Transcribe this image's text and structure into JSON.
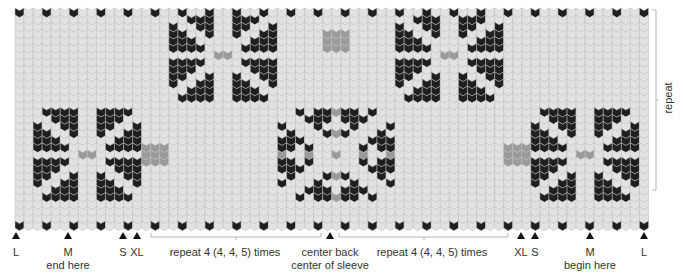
{
  "chart": {
    "colors": {
      "dark": "#1f1f1f",
      "light": "#e2e2e2",
      "accent": "#9a9a9a",
      "outline": "#bdbdbd"
    },
    "columns": 70,
    "rows": 31
  },
  "repeat_label": "repeat",
  "markers": [
    {
      "id": "L-left",
      "label": "L",
      "sub": ""
    },
    {
      "id": "M-left",
      "label": "M",
      "sub": "end here"
    },
    {
      "id": "S-left",
      "label": "S",
      "sub": ""
    },
    {
      "id": "XL-left",
      "label": "XL",
      "sub": ""
    },
    {
      "id": "center",
      "label": "center back",
      "sub": "center of sleeve"
    },
    {
      "id": "XL-right",
      "label": "XL",
      "sub": ""
    },
    {
      "id": "S-right",
      "label": "S",
      "sub": ""
    },
    {
      "id": "M-right",
      "label": "M",
      "sub": "begin here"
    },
    {
      "id": "L-right",
      "label": "L",
      "sub": ""
    }
  ],
  "repeat_brackets": [
    {
      "label": "repeat 4 (4, 4, 5) times"
    },
    {
      "label": "repeat 4 (4, 4, 5) times"
    }
  ]
}
